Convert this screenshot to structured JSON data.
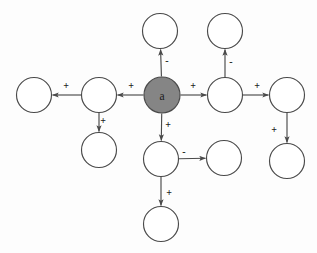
{
  "diagram": {
    "background_color": "#fdfdfd",
    "stroke_color": "#4a4a4a",
    "node_fill_plain": "#ffffff",
    "node_fill_highlight": "#858585",
    "label_color": "#1a1a1a",
    "center_node_label": "a",
    "nodes": [
      {
        "id": "n-center",
        "label": "a",
        "cx": 162,
        "cy": 95,
        "r": 18,
        "highlighted": true
      },
      {
        "id": "n-top",
        "label": "",
        "cx": 160,
        "cy": 31,
        "r": 17.5,
        "highlighted": false
      },
      {
        "id": "n-top-right",
        "label": "",
        "cx": 225,
        "cy": 31,
        "r": 17.5,
        "highlighted": false
      },
      {
        "id": "n-left-mid",
        "label": "",
        "cx": 99,
        "cy": 95,
        "r": 17.5,
        "highlighted": false
      },
      {
        "id": "n-left-far",
        "label": "",
        "cx": 34,
        "cy": 95,
        "r": 17.5,
        "highlighted": false
      },
      {
        "id": "n-left-lower",
        "label": "",
        "cx": 99,
        "cy": 150,
        "r": 17.5,
        "highlighted": false
      },
      {
        "id": "n-right-mid",
        "label": "",
        "cx": 225,
        "cy": 95,
        "r": 17.5,
        "highlighted": false
      },
      {
        "id": "n-right-far",
        "label": "",
        "cx": 287,
        "cy": 95,
        "r": 17.5,
        "highlighted": false
      },
      {
        "id": "n-right-lower",
        "label": "",
        "cx": 287,
        "cy": 161,
        "r": 17.5,
        "highlighted": false
      },
      {
        "id": "n-bottom-mid",
        "label": "",
        "cx": 161,
        "cy": 159,
        "r": 17.5,
        "highlighted": false
      },
      {
        "id": "n-bottom-right",
        "label": "",
        "cx": 224,
        "cy": 158,
        "r": 17.5,
        "highlighted": false
      },
      {
        "id": "n-bottom-far",
        "label": "",
        "cx": 161,
        "cy": 224,
        "r": 17.5,
        "highlighted": false
      }
    ],
    "edges": [
      {
        "id": "e-center-top",
        "from": "n-center",
        "to": "n-top",
        "sign": "-",
        "label_x": 167,
        "label_y": 60
      },
      {
        "id": "e-center-left",
        "from": "n-center",
        "to": "n-left-mid",
        "sign": "+",
        "label_x": 131,
        "label_y": 85
      },
      {
        "id": "e-center-right",
        "from": "n-center",
        "to": "n-right-mid",
        "sign": "+",
        "label_x": 193,
        "label_y": 85
      },
      {
        "id": "e-center-bottom",
        "from": "n-center",
        "to": "n-bottom-mid",
        "sign": "+",
        "label_x": 168,
        "label_y": 124
      },
      {
        "id": "e-leftmid-leftfar",
        "from": "n-left-mid",
        "to": "n-left-far",
        "sign": "+",
        "label_x": 66,
        "label_y": 85
      },
      {
        "id": "e-leftmid-leftlower",
        "from": "n-left-mid",
        "to": "n-left-lower",
        "sign": "+",
        "label_x": 103,
        "label_y": 120
      },
      {
        "id": "e-rightmid-topright",
        "from": "n-right-mid",
        "to": "n-top-right",
        "sign": "-",
        "label_x": 231,
        "label_y": 61
      },
      {
        "id": "e-rightmid-rightfar",
        "from": "n-right-mid",
        "to": "n-right-far",
        "sign": "+",
        "label_x": 257,
        "label_y": 85
      },
      {
        "id": "e-rightfar-rightlower",
        "from": "n-right-far",
        "to": "n-right-lower",
        "sign": "+",
        "label_x": 274,
        "label_y": 129
      },
      {
        "id": "e-bottommid-bottomright",
        "from": "n-bottom-mid",
        "to": "n-bottom-right",
        "sign": "-",
        "label_x": 184,
        "label_y": 151
      },
      {
        "id": "e-bottommid-bottomfar",
        "from": "n-bottom-mid",
        "to": "n-bottom-far",
        "sign": "+",
        "label_x": 169,
        "label_y": 192
      }
    ]
  }
}
